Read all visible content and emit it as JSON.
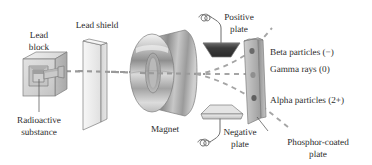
{
  "figure": {
    "background_color": "#ffffff",
    "width": 372,
    "height": 165
  },
  "labels": {
    "lead_block": "Lead\nblock",
    "lead_block_line1": "Lead",
    "lead_block_line2": "block",
    "lead_shield": "Lead shield",
    "radioactive_substance_line1": "Radioactive",
    "radioactive_substance_line2": "substance",
    "magnet": "Magnet",
    "positive_plate_line1": "Positive",
    "positive_plate_line2": "plate",
    "negative_plate_line1": "Negative",
    "negative_plate_line2": "plate",
    "phosphor_plate_line1": "Phosphor-coated",
    "phosphor_plate_line2": "plate",
    "beta": "Beta particles (−)",
    "gamma": "Gamma rays (0)",
    "alpha": "Alpha particles (2+)"
  },
  "components": [
    {
      "name": "lead-block",
      "label": "Lead block",
      "description": "Shielded 3D cube with cavity"
    },
    {
      "name": "radioactive-substance",
      "label": "Radioactive substance",
      "description": "Sample inside lead block cavity"
    },
    {
      "name": "lead-shield",
      "label": "Lead shield",
      "description": "Collimating slab with slit"
    },
    {
      "name": "magnet",
      "label": "Magnet",
      "description": "Toroidal magnet"
    },
    {
      "name": "positive-plate",
      "label": "Positive plate",
      "description": "Dark trapezoid electrode, upper"
    },
    {
      "name": "negative-plate",
      "label": "Negative plate",
      "description": "Light trapezoid electrode, lower"
    },
    {
      "name": "phosphor-coated-plate",
      "label": "Phosphor-coated plate",
      "description": "Vertical detector slab with three impact spots"
    }
  ],
  "rays": [
    {
      "name": "beta-ray",
      "label": "Beta particles (−)",
      "charge": "−",
      "deflection": "up, toward positive plate"
    },
    {
      "name": "gamma-ray",
      "label": "Gamma rays (0)",
      "charge": "0",
      "deflection": "undeflected, straight"
    },
    {
      "name": "alpha-ray",
      "label": "Alpha particles (2+)",
      "charge": "2+",
      "deflection": "down, toward negative plate"
    }
  ],
  "colors": {
    "ray": "#9a9a9a",
    "text": "#2b2b2b",
    "leader": "#4a4a4a",
    "plate_positive": "#3a3a3a",
    "plate_negative": "#d8d8d8",
    "shield": "#eeeeee",
    "magnet": "#bdbdbd"
  }
}
